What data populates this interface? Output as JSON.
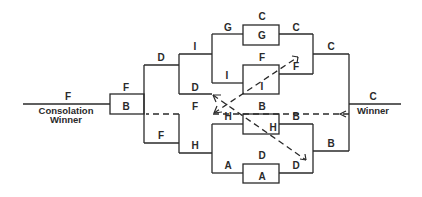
{
  "diagram": {
    "colors": {
      "line": "#2a2a2a",
      "background": "#ffffff"
    },
    "consolation": {
      "winner_team": "F",
      "caption_line1": "Consolation",
      "caption_line2": "Winner"
    },
    "champion": {
      "winner_team": "C",
      "caption": "Winner"
    },
    "final_box": {
      "top": "F",
      "bottom": "B"
    },
    "labels": {
      "l_d_top": "D",
      "l_f_bottom": "F",
      "l_i_1": "I",
      "l_d_1": "D",
      "l_f_1": "F",
      "l_h_1": "H",
      "l_g_2": "G",
      "l_i_2": "I",
      "l_h_2": "H",
      "l_a_2": "A",
      "box_g_above": "C",
      "box_g_inside": "G",
      "box_fi_above": "F",
      "box_fi_inside": "I",
      "box_bh_above": "B",
      "box_bh_inside": "H",
      "box_a_above": "D",
      "box_a_inside": "A",
      "r_c_1": "C",
      "r_f_1": "F",
      "r_b_1": "B",
      "r_d_1": "D",
      "r_c_2": "C",
      "r_b_2": "B"
    }
  }
}
